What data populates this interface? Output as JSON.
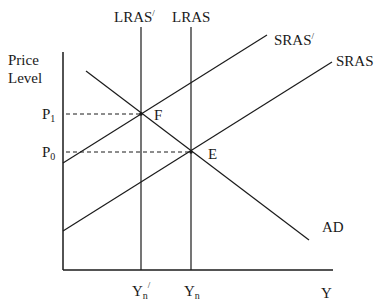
{
  "diagram": {
    "type": "economics-AD-AS",
    "y_axis_label_line1": "Price",
    "y_axis_label_line2": "Level",
    "x_axis_label": "Y",
    "price_labels": {
      "p1_base": "P",
      "p1_sub": "1",
      "p0_base": "P",
      "p0_sub": "0"
    },
    "output_labels": {
      "yn_prime_base": "Y",
      "yn_prime_sub": "n",
      "yn_prime_mark": "/",
      "yn_base": "Y",
      "yn_sub": "n"
    },
    "curves": {
      "lras_prime": "LRAS",
      "lras_prime_mark": "/",
      "lras": "LRAS",
      "sras_prime": "SRAS",
      "sras_prime_mark": "/",
      "sras": "SRAS",
      "ad": "AD"
    },
    "points": {
      "f": "F",
      "e": "E"
    }
  }
}
